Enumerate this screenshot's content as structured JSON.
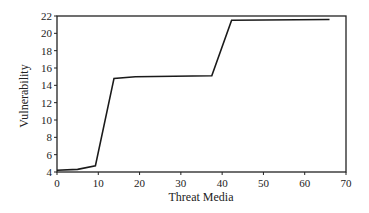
{
  "chart_data": {
    "type": "line",
    "title": "",
    "xlabel": "Threat Media",
    "ylabel": "Vulnerability",
    "xlim": [
      0,
      70
    ],
    "ylim": [
      4,
      22
    ],
    "xticks": [
      0,
      10,
      20,
      30,
      40,
      50,
      60,
      70
    ],
    "yticks": [
      4,
      6,
      8,
      10,
      12,
      14,
      16,
      18,
      20,
      22
    ],
    "grid": false,
    "legend": null,
    "series": [
      {
        "name": "Vulnerability",
        "color": "#1a1a1a",
        "x": [
          0,
          5,
          9.3,
          13.8,
          19,
          37.5,
          42.3,
          66
        ],
        "y": [
          4.2,
          4.3,
          4.7,
          14.8,
          15.0,
          15.1,
          21.5,
          21.6
        ]
      }
    ]
  },
  "plot": {
    "left": 57,
    "right": 346,
    "top": 16,
    "bottom": 172
  }
}
